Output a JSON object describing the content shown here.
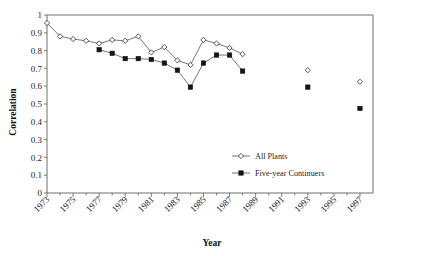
{
  "chart_data": {
    "type": "line",
    "title": "",
    "xlabel": "Year",
    "ylabel": "Correlation",
    "xlim": [
      1973,
      1998
    ],
    "ylim": [
      0,
      1
    ],
    "grid": false,
    "legend_position": "inside-lower-right",
    "y_ticks": [
      "0",
      "0.1",
      "0.2",
      "0.3",
      "0.4",
      "0.5",
      "0.6",
      "0.7",
      "0.8",
      "0.9",
      "1"
    ],
    "y_tick_values": [
      0,
      0.1,
      0.2,
      0.3,
      0.4,
      0.5,
      0.6,
      0.7,
      0.8,
      0.9,
      1
    ],
    "x_ticks": [
      "1973",
      "1975",
      "1977",
      "1979",
      "1981",
      "1983",
      "1985",
      "1987",
      "1989",
      "1991",
      "1993",
      "1995",
      "1997"
    ],
    "x_tick_values": [
      1973,
      1975,
      1977,
      1979,
      1981,
      1983,
      1985,
      1987,
      1989,
      1991,
      1993,
      1995,
      1997
    ],
    "x_minor_step": 1,
    "series": [
      {
        "name": "All Plants",
        "marker": "open-diamond",
        "marker_color": "#ffffff",
        "line_color": "#3b3b3b",
        "x": [
          1973,
          1974,
          1975,
          1976,
          1977,
          1978,
          1979,
          1980,
          1981,
          1982,
          1983,
          1984,
          1985,
          1986,
          1987,
          1988,
          1993,
          1997
        ],
        "values": [
          0.955,
          0.88,
          0.865,
          0.855,
          0.84,
          0.86,
          0.855,
          0.88,
          0.79,
          0.82,
          0.745,
          0.72,
          0.86,
          0.84,
          0.815,
          0.78,
          0.69,
          0.625
        ],
        "connected_through": 1988
      },
      {
        "name": "Five-year Continuers",
        "marker": "filled-square",
        "marker_color": "#141414",
        "line_color": "#3b3b3b",
        "x": [
          1977,
          1978,
          1979,
          1980,
          1981,
          1982,
          1983,
          1984,
          1985,
          1986,
          1987,
          1988,
          1993,
          1997
        ],
        "values": [
          0.805,
          0.785,
          0.755,
          0.755,
          0.75,
          0.73,
          0.69,
          0.595,
          0.73,
          0.775,
          0.775,
          0.685,
          0.595,
          0.475
        ],
        "connected_through": 1988
      }
    ]
  },
  "legend": {
    "entries": [
      {
        "label": "All Plants",
        "marker": "open-diamond"
      },
      {
        "label": "Five-year Continuers",
        "marker": "filled-square"
      }
    ]
  },
  "axes": {
    "x_title": "Year",
    "y_title": "Correlation"
  }
}
